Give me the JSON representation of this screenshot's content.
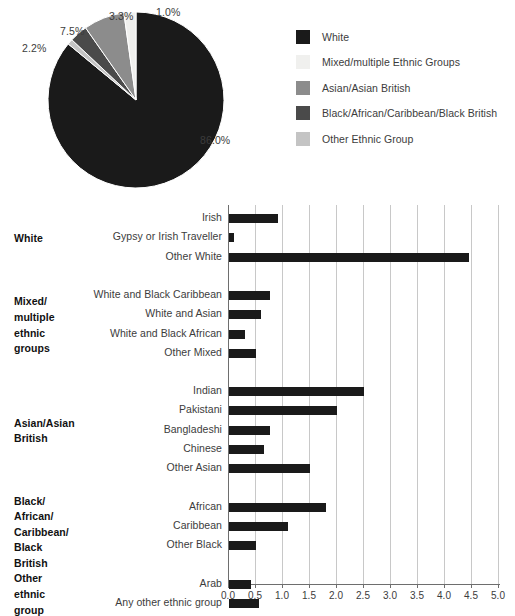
{
  "pie": {
    "labels": [
      "86.0%",
      "2.2%",
      "7.5%",
      "3.3%",
      "1.0%"
    ],
    "legend": [
      {
        "label": "White",
        "color": "#1a1a1a",
        "value": 86.0
      },
      {
        "label": "Mixed/multiple Ethnic Groups",
        "color": "#f0f0ee",
        "value": 2.2
      },
      {
        "label": "Asian/Asian British",
        "color": "#8c8c8c",
        "value": 7.5
      },
      {
        "label": "Black/African/Caribbean/Black British",
        "color": "#4a4a4a",
        "value": 3.3
      },
      {
        "label": "Other Ethnic Group",
        "color": "#c4c4c4",
        "value": 1.0
      }
    ]
  },
  "chart_data": [
    {
      "type": "pie",
      "title": "",
      "categories": [
        "White",
        "Mixed/multiple Ethnic Groups",
        "Asian/Asian British",
        "Black/African/Caribbean/Black British",
        "Other Ethnic Group"
      ],
      "values": [
        86.0,
        2.2,
        7.5,
        3.3,
        1.0
      ],
      "data_labels": [
        "86.0%",
        "2.2%",
        "7.5%",
        "3.3%",
        "1.0%"
      ],
      "colors": [
        "#1a1a1a",
        "#f0f0ee",
        "#8c8c8c",
        "#4a4a4a",
        "#c4c4c4"
      ],
      "legend_position": "right"
    },
    {
      "type": "bar",
      "orientation": "horizontal",
      "title": "",
      "xlabel": "",
      "ylabel": "",
      "xlim": [
        0.0,
        5.0
      ],
      "xticks": [
        "0.0",
        "0.5",
        "1.0",
        "1.5",
        "2.0",
        "2.5",
        "3.0",
        "3.5",
        "4.0",
        "4.5",
        "5.0"
      ],
      "grid": true,
      "bar_color": "#1a1a1a",
      "groups": [
        {
          "name": "White",
          "name_lines": [
            "White"
          ],
          "categories": [
            "Irish",
            "Gypsy or Irish Traveller",
            "Other White"
          ],
          "values": [
            0.9,
            0.1,
            4.45
          ]
        },
        {
          "name": "Mixed/multiple ethnic groups",
          "name_lines": [
            "Mixed/",
            "multiple",
            "ethnic",
            "groups"
          ],
          "categories": [
            "White and Black Caribbean",
            "White and Asian",
            "White and Black African",
            "Other Mixed"
          ],
          "values": [
            0.75,
            0.6,
            0.3,
            0.5
          ]
        },
        {
          "name": "Asian/Asian British",
          "name_lines": [
            "Asian/Asian",
            "British"
          ],
          "categories": [
            "Indian",
            "Pakistani",
            "Bangladeshi",
            "Chinese",
            "Other Asian"
          ],
          "values": [
            2.5,
            2.0,
            0.75,
            0.65,
            1.5
          ]
        },
        {
          "name": "Black/African/Caribbean/Black British",
          "name_lines": [
            "Black/",
            "African/",
            "Caribbean/",
            "Black",
            "British"
          ],
          "categories": [
            "African",
            "Caribbean",
            "Other Black"
          ],
          "values": [
            1.8,
            1.1,
            0.5
          ]
        },
        {
          "name": "Other ethnic group",
          "name_lines": [
            "Other",
            "ethnic",
            "group"
          ],
          "categories": [
            "Arab",
            "Any other ethnic group"
          ],
          "values": [
            0.4,
            0.55
          ]
        }
      ]
    }
  ]
}
